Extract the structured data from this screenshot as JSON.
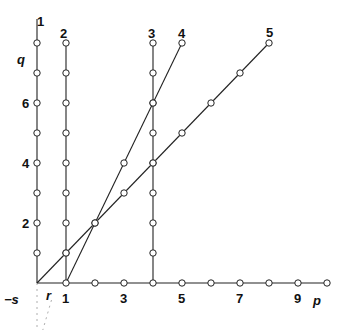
{
  "diagram": {
    "origin_px": [
      37,
      283
    ],
    "unit_px": [
      29,
      30
    ],
    "axes": {
      "x_label": "p",
      "y_label": "q",
      "x_tick_labels": [
        {
          "v": 1,
          "t": "1"
        },
        {
          "v": 3,
          "t": "3"
        },
        {
          "v": 5,
          "t": "5"
        },
        {
          "v": 7,
          "t": "7"
        },
        {
          "v": 9,
          "t": "9"
        }
      ],
      "y_tick_labels": [
        {
          "v": 2,
          "t": "2"
        },
        {
          "v": 4,
          "t": "4"
        },
        {
          "v": 6,
          "t": "6"
        }
      ],
      "x_points": [
        1,
        2,
        3,
        4,
        5,
        6,
        7,
        8,
        9
      ],
      "x_end_open": 10
    },
    "origin_labels": {
      "neg_s": "−s",
      "r": "r"
    },
    "lines": [
      {
        "id": "1",
        "label": "1",
        "from": [
          0,
          0
        ],
        "to": [
          0,
          8.8
        ],
        "points": [
          1,
          2,
          3,
          4,
          5,
          6,
          7,
          8
        ],
        "open_end": false
      },
      {
        "id": "2",
        "label": "2",
        "from": [
          1,
          0
        ],
        "to": [
          1,
          8
        ],
        "points": [
          1,
          2,
          3,
          4,
          5,
          6,
          7
        ],
        "open_end": true
      },
      {
        "id": "3",
        "label": "3",
        "from": [
          4,
          0
        ],
        "to": [
          4,
          8
        ],
        "points": [
          1,
          2,
          3,
          4,
          5,
          6,
          7
        ],
        "open_end": true
      },
      {
        "id": "4",
        "label": "4",
        "from": [
          1,
          0
        ],
        "to": [
          5,
          8
        ],
        "points_xy": [
          [
            2,
            2
          ],
          [
            3,
            4
          ],
          [
            4,
            6
          ]
        ],
        "open_end": true
      },
      {
        "id": "5",
        "label": "5",
        "from": [
          0,
          0
        ],
        "to": [
          8,
          8
        ],
        "points_xy": [
          [
            1,
            1
          ],
          [
            2,
            2
          ],
          [
            3,
            3
          ],
          [
            4,
            4
          ],
          [
            5,
            5
          ],
          [
            6,
            6
          ],
          [
            7,
            7
          ]
        ],
        "open_end": true
      }
    ],
    "color": "#222222"
  }
}
